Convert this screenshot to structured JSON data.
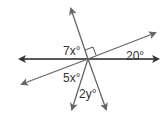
{
  "diagram": {
    "type": "intersecting-lines-angles",
    "labels": {
      "a": "7x°",
      "b": "20°",
      "c": "5x°",
      "d": "2y°"
    },
    "right_angle_marker": true,
    "colors": {
      "line": "#555555",
      "horizontal": "#222222",
      "text": "#333333"
    }
  }
}
